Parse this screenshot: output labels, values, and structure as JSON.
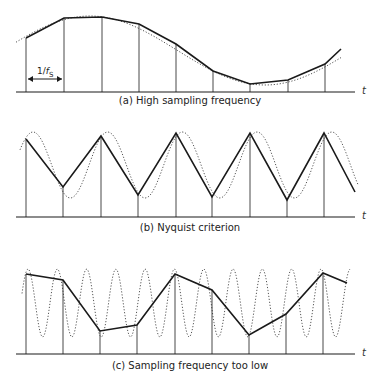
{
  "panels": [
    {
      "id": "a",
      "caption": "(a) High sampling frequency",
      "axis_label": "t",
      "period_label": "1/fs",
      "axis_y": 92,
      "axis_x0": 16,
      "axis_x1": 355,
      "samples": [
        [
          26,
          38
        ],
        [
          64,
          18
        ],
        [
          102,
          17
        ],
        [
          139,
          24
        ],
        [
          176,
          44
        ],
        [
          213,
          71
        ],
        [
          250,
          84
        ],
        [
          288,
          80
        ],
        [
          325,
          64
        ]
      ],
      "line_end": [
        341,
        49
      ],
      "signal": {
        "type": "cos",
        "x0": 16,
        "x1": 341,
        "desc": "slow sinusoid, continuous dotted"
      }
    },
    {
      "id": "b",
      "caption": "(b) Nyquist criterion",
      "axis_label": "t",
      "axis_y": 217,
      "axis_x0": 16,
      "axis_x1": 355,
      "samples": [
        [
          26,
          139
        ],
        [
          63,
          187
        ],
        [
          101,
          136
        ],
        [
          138,
          195
        ],
        [
          176,
          133
        ],
        [
          212,
          197
        ],
        [
          250,
          133
        ],
        [
          287,
          200
        ],
        [
          324,
          133
        ]
      ],
      "line_end": [
        355,
        192
      ],
      "signal": {
        "desc": "sinusoid at half sampling frequency, dotted"
      }
    },
    {
      "id": "c",
      "caption": "(c) Sampling frequency too low",
      "axis_label": "t",
      "axis_y": 354,
      "axis_x0": 16,
      "axis_x1": 355,
      "samples": [
        [
          26,
          274
        ],
        [
          63,
          280
        ],
        [
          100,
          331
        ],
        [
          137,
          325
        ],
        [
          175,
          274
        ],
        [
          212,
          290
        ],
        [
          249,
          335
        ],
        [
          286,
          314
        ],
        [
          323,
          273
        ]
      ],
      "line_end": [
        347,
        283
      ],
      "signal": {
        "desc": "high-frequency sinusoid, dotted, aliased"
      }
    }
  ],
  "colors": {
    "sample_line": "#1a1a1a",
    "signal": "#555555",
    "axis": "#1a1a1a"
  }
}
